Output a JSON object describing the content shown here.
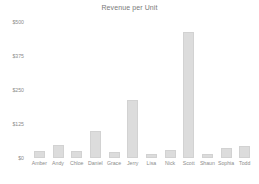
{
  "chart_data": {
    "type": "bar",
    "title": "Revenue per Unit",
    "xlabel": "",
    "ylabel": "",
    "ylim": [
      0,
      500
    ],
    "grid": false,
    "legend": null,
    "ytick_labels": [
      "$500",
      "$375",
      "$250",
      "$125",
      "$0"
    ],
    "ytick_values": [
      500,
      375,
      250,
      125,
      0
    ],
    "categories": [
      "Amber",
      "Andy",
      "Chloe",
      "Daniel",
      "Grace",
      "Jerry",
      "Lisa",
      "Nick",
      "Scott",
      "Shaun",
      "Sophia",
      "Todd"
    ],
    "values": [
      25,
      48,
      25,
      100,
      22,
      215,
      15,
      30,
      465,
      15,
      38,
      45
    ],
    "bar_color": "#dcdcdc",
    "text_color": "#8c8c8c",
    "background_color": "#ffffff"
  }
}
